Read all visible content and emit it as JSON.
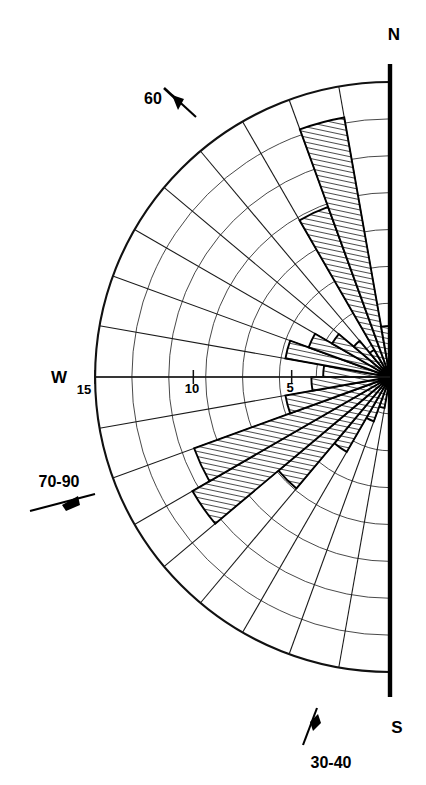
{
  "figure": {
    "type": "rose-diagram",
    "orientation": "half-circle-west",
    "background_color": "#ffffff",
    "line_color": "#000000"
  },
  "cardinals": {
    "north": "N",
    "west": "W",
    "south": "S"
  },
  "radial_axis": {
    "labels": [
      "15",
      "10",
      "5"
    ],
    "values": [
      15,
      10,
      5
    ],
    "max": 15,
    "ring_interval": 1.875,
    "major_ring_values": [
      5,
      10,
      15
    ]
  },
  "annotations": [
    {
      "text": "60",
      "icon": "wind-barb-icon"
    },
    {
      "text": "70-90",
      "icon": "wind-barb-icon"
    },
    {
      "text": "30-40",
      "icon": "wind-barb-icon"
    }
  ],
  "chart_data": {
    "type": "bar",
    "subtype": "rose-diagram",
    "title": "",
    "xlabel": "",
    "ylabel": "",
    "grid": true,
    "legend_position": "none",
    "angular_unit": "degrees",
    "angular_sector_width": 10,
    "angular_range": [
      180,
      360
    ],
    "radial_range": [
      0,
      15
    ],
    "radial_ticks": [
      5,
      10,
      15
    ],
    "radial_tick_labels": [
      "5",
      "10",
      "15"
    ],
    "categories": [
      "355",
      "345",
      "335",
      "325",
      "315",
      "305",
      "295",
      "285",
      "275",
      "265",
      "255",
      "245",
      "235",
      "225",
      "215",
      "205",
      "195",
      "185"
    ],
    "series": [
      {
        "name": "frequency",
        "values": [
          0.8,
          1.6,
          2.4,
          4.4,
          7.4,
          11.6,
          10.6,
          5.4,
          4.0,
          3.4,
          5.4,
          4.4,
          3.4,
          2.4,
          1.6,
          9.2,
          13.4,
          2.6
        ]
      }
    ]
  }
}
